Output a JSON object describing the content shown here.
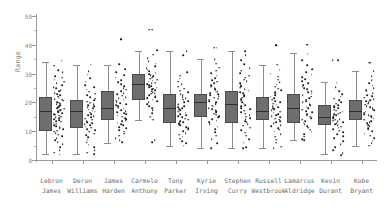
{
  "chart_data": {
    "type": "box",
    "title": "",
    "xlabel": "",
    "ylabel": "Range",
    "ylim": [
      0,
      50
    ],
    "yticks": [
      0,
      10,
      20,
      30,
      40,
      50
    ],
    "ytick_labels": [
      "0",
      "10",
      "20",
      "30",
      "40",
      "50"
    ],
    "grid": false,
    "legend": "none",
    "overlay": "jittered strip plot of individual observations",
    "categories": [
      "Lebron James",
      "Deron Williams",
      "James Harden",
      "Carmelo Anthony",
      "Tony Parker",
      "Kyrie Irving",
      "Stephen Curry",
      "Russell Westbrook",
      "Lamarcus Aldridge",
      "Kevin Durant",
      "Kobe Bryant"
    ],
    "category_lines": [
      [
        "Lebron",
        "James"
      ],
      [
        "Deron",
        "Williams"
      ],
      [
        "James",
        "Harden"
      ],
      [
        "Carmelo",
        "Anthony"
      ],
      [
        "Tony",
        "Parker"
      ],
      [
        "Kyrie",
        "Irving"
      ],
      [
        "Stephen",
        "Curry"
      ],
      [
        "Russell",
        "Westbrook"
      ],
      [
        "Lamarcus",
        "Aldridge"
      ],
      [
        "Kevin",
        "Durant"
      ],
      [
        "Kobe",
        "Bryant"
      ]
    ],
    "boxes": [
      {
        "name": "Lebron James",
        "whisker_low": 2,
        "q1": 10,
        "median": 17,
        "q3": 22,
        "whisker_high": 34
      },
      {
        "name": "Deron Williams",
        "whisker_low": 2,
        "q1": 11,
        "median": 17,
        "q3": 21,
        "whisker_high": 33
      },
      {
        "name": "James Harden",
        "whisker_low": 6,
        "q1": 14,
        "median": 18,
        "q3": 24,
        "whisker_high": 33
      },
      {
        "name": "Carmelo Anthony",
        "whisker_low": 14,
        "q1": 21,
        "median": 26.5,
        "q3": 30,
        "whisker_high": 38
      },
      {
        "name": "Tony Parker",
        "whisker_low": 5,
        "q1": 13,
        "median": 18,
        "q3": 23,
        "whisker_high": 38
      },
      {
        "name": "Kyrie Irving",
        "whisker_low": 4,
        "q1": 15,
        "median": 20,
        "q3": 23,
        "whisker_high": 35
      },
      {
        "name": "Stephen Curry",
        "whisker_low": 4,
        "q1": 13,
        "median": 19.5,
        "q3": 24,
        "whisker_high": 38
      },
      {
        "name": "Russell Westbrook",
        "whisker_low": 4,
        "q1": 14,
        "median": 17,
        "q3": 22,
        "whisker_high": 33
      },
      {
        "name": "Lamarcus Aldridge",
        "whisker_low": 7,
        "q1": 13,
        "median": 18,
        "q3": 23,
        "whisker_high": 37
      },
      {
        "name": "Kevin Durant",
        "whisker_low": 2,
        "q1": 12,
        "median": 15,
        "q3": 19,
        "whisker_high": 27
      },
      {
        "name": "Kobe Bryant",
        "whisker_low": 5,
        "q1": 14,
        "median": 17,
        "q3": 21,
        "whisker_high": 31
      }
    ],
    "outliers": [
      {
        "name": "James Harden",
        "values": [
          42
        ]
      },
      {
        "name": "Carmelo Anthony",
        "values": [
          45.3
        ]
      },
      {
        "name": "Kyrie Irving",
        "values": [
          39
        ]
      },
      {
        "name": "Russell Westbrook",
        "values": [
          39.8
        ]
      },
      {
        "name": "Lamarcus Aldridge",
        "values": [
          40
        ]
      },
      {
        "name": "Kevin Durant",
        "values": [
          34.6
        ]
      },
      {
        "name": "Kobe Bryant",
        "values": [
          33.8
        ]
      }
    ],
    "points": [
      {
        "name": "Lebron James",
        "values": [
          34.5,
          32.8,
          31.2,
          30.4,
          29.1,
          28.6,
          27.9,
          27.2,
          26.6,
          26.0,
          25.4,
          24.9,
          24.3,
          23.8,
          23.2,
          22.8,
          22.4,
          22.0,
          21.6,
          21.2,
          20.9,
          20.6,
          20.2,
          19.9,
          19.6,
          19.3,
          19.0,
          18.7,
          18.4,
          18.1,
          17.8,
          17.5,
          17.2,
          16.9,
          16.6,
          16.3,
          16.0,
          15.7,
          15.4,
          15.1,
          14.8,
          14.5,
          14.2,
          13.9,
          13.6,
          13.3,
          13.0,
          12.6,
          12.2,
          11.8,
          11.4,
          11.0,
          10.6,
          10.2,
          9.8,
          9.3,
          8.8,
          8.2,
          7.6,
          6.9,
          6.2,
          5.4,
          4.5,
          3.5,
          2.6,
          1.9
        ]
      },
      {
        "name": "Deron Williams",
        "values": [
          33.1,
          30.8,
          29.6,
          28.4,
          27.2,
          26.1,
          25.2,
          24.4,
          23.7,
          23.0,
          22.4,
          21.8,
          21.3,
          20.8,
          20.3,
          19.9,
          19.5,
          19.1,
          18.7,
          18.3,
          17.9,
          17.5,
          17.1,
          16.8,
          16.4,
          16.0,
          15.6,
          15.2,
          14.8,
          14.4,
          14.0,
          13.6,
          13.2,
          12.8,
          12.4,
          12.0,
          11.6,
          11.2,
          10.8,
          10.3,
          9.8,
          9.2,
          8.6,
          7.9,
          7.1,
          6.2,
          5.3,
          4.4,
          3.5,
          2.6,
          2.0
        ]
      },
      {
        "name": "James Harden",
        "values": [
          42.0,
          33.2,
          31.6,
          30.5,
          29.5,
          28.6,
          27.8,
          27.0,
          26.3,
          25.6,
          25.0,
          24.4,
          23.8,
          23.3,
          22.8,
          22.3,
          21.9,
          21.4,
          21.0,
          20.6,
          20.2,
          19.8,
          19.4,
          19.0,
          18.6,
          18.2,
          17.8,
          17.4,
          17.0,
          16.6,
          16.2,
          15.8,
          15.4,
          15.0,
          14.6,
          14.2,
          13.8,
          13.4,
          13.0,
          12.5,
          12.0,
          11.5,
          11.0,
          10.4,
          9.8,
          9.1,
          8.4,
          7.6,
          6.8,
          6.1
        ]
      },
      {
        "name": "Carmelo Anthony",
        "values": [
          45.3,
          38.1,
          36.6,
          35.4,
          34.4,
          33.5,
          32.7,
          32.0,
          31.4,
          30.8,
          30.3,
          29.8,
          29.4,
          29.0,
          28.6,
          28.2,
          27.9,
          27.5,
          27.2,
          26.9,
          26.6,
          26.3,
          26.0,
          25.7,
          25.4,
          25.1,
          24.8,
          24.5,
          24.2,
          23.9,
          23.6,
          23.3,
          23.0,
          22.6,
          22.2,
          21.8,
          21.4,
          21.0,
          20.5,
          20.0,
          19.4,
          18.8,
          18.0,
          17.2,
          16.2,
          15.1,
          14.0,
          6.8,
          6.2
        ]
      },
      {
        "name": "Tony Parker",
        "values": [
          37.9,
          36.4,
          30.6,
          29.3,
          28.2,
          27.2,
          26.3,
          25.5,
          24.8,
          24.1,
          23.5,
          22.9,
          22.4,
          21.9,
          21.4,
          20.9,
          20.4,
          20.0,
          19.6,
          19.2,
          18.8,
          18.4,
          18.0,
          17.6,
          17.2,
          16.8,
          16.4,
          16.0,
          15.6,
          15.2,
          14.8,
          14.4,
          14.0,
          13.6,
          13.2,
          12.8,
          12.4,
          12.0,
          11.5,
          11.0,
          10.5,
          10.0,
          9.4,
          8.8,
          8.1,
          7.4,
          6.6,
          5.8,
          5.0
        ]
      },
      {
        "name": "Kyrie Irving",
        "values": [
          39.0,
          35.1,
          33.4,
          32.1,
          31.0,
          30.1,
          29.3,
          28.5,
          27.8,
          27.2,
          26.6,
          26.0,
          25.5,
          25.0,
          24.5,
          24.1,
          23.7,
          23.3,
          22.9,
          22.5,
          22.1,
          21.7,
          21.3,
          20.9,
          20.5,
          20.1,
          19.7,
          19.3,
          18.9,
          18.5,
          18.1,
          17.7,
          17.3,
          16.9,
          16.5,
          16.1,
          15.7,
          15.3,
          14.8,
          14.3,
          13.7,
          13.1,
          12.4,
          11.6,
          10.7,
          9.7,
          8.5,
          7.2,
          5.8,
          4.2
        ]
      },
      {
        "name": "Stephen Curry",
        "values": [
          37.8,
          36.3,
          34.6,
          33.2,
          32.0,
          31.0,
          30.1,
          29.3,
          28.6,
          27.9,
          27.3,
          26.7,
          26.1,
          25.6,
          25.1,
          24.6,
          24.1,
          23.6,
          23.1,
          22.6,
          22.1,
          21.6,
          21.1,
          20.6,
          20.1,
          19.6,
          19.1,
          18.6,
          18.1,
          17.6,
          17.1,
          16.6,
          16.1,
          15.6,
          15.1,
          14.6,
          14.1,
          13.6,
          13.1,
          12.5,
          11.9,
          11.2,
          10.4,
          9.5,
          8.5,
          7.3,
          6.0,
          4.4,
          4.0
        ]
      },
      {
        "name": "Russell Westbrook",
        "values": [
          39.8,
          33.1,
          31.4,
          30.0,
          28.9,
          27.9,
          27.0,
          26.2,
          25.5,
          24.8,
          24.2,
          23.6,
          23.0,
          22.5,
          22.0,
          21.5,
          21.0,
          20.5,
          20.0,
          19.6,
          19.2,
          18.8,
          18.4,
          18.0,
          17.6,
          17.2,
          16.8,
          16.4,
          16.0,
          15.6,
          15.2,
          14.8,
          14.4,
          14.0,
          13.6,
          13.2,
          12.7,
          12.2,
          11.7,
          11.1,
          10.5,
          9.8,
          9.0,
          8.1,
          7.1,
          6.0,
          4.6,
          4.0
        ]
      },
      {
        "name": "Lamarcus Aldridge",
        "values": [
          40.0,
          36.9,
          34.6,
          32.9,
          31.6,
          30.5,
          29.6,
          28.8,
          28.0,
          27.3,
          26.7,
          26.1,
          25.5,
          25.0,
          24.5,
          24.0,
          23.5,
          23.0,
          22.5,
          22.0,
          21.5,
          21.0,
          20.5,
          20.0,
          19.5,
          19.0,
          18.5,
          18.0,
          17.5,
          17.0,
          16.5,
          16.0,
          15.5,
          15.0,
          14.5,
          14.0,
          13.5,
          13.0,
          12.4,
          11.8,
          11.2,
          10.5,
          9.8,
          9.0,
          8.1,
          7.2,
          6.8
        ]
      },
      {
        "name": "Kevin Durant",
        "values": [
          34.6,
          26.9,
          25.2,
          23.9,
          22.9,
          22.0,
          21.3,
          20.7,
          20.1,
          19.6,
          19.1,
          18.7,
          18.3,
          17.9,
          17.5,
          17.1,
          16.8,
          16.4,
          16.1,
          15.8,
          15.5,
          15.2,
          14.9,
          14.6,
          14.3,
          14.0,
          13.7,
          13.4,
          13.1,
          12.8,
          12.4,
          12.0,
          11.6,
          11.2,
          10.7,
          10.2,
          9.6,
          9.0,
          8.3,
          7.5,
          6.6,
          5.6,
          4.5,
          3.4,
          2.4,
          1.8
        ]
      },
      {
        "name": "Kobe Bryant",
        "values": [
          33.8,
          30.8,
          29.1,
          27.8,
          26.7,
          25.8,
          25.0,
          24.3,
          23.7,
          23.1,
          22.6,
          22.1,
          21.6,
          21.2,
          20.8,
          20.4,
          20.0,
          19.6,
          19.2,
          18.8,
          18.4,
          18.0,
          17.6,
          17.2,
          16.8,
          16.4,
          16.0,
          15.6,
          15.2,
          14.8,
          14.4,
          14.0,
          13.6,
          13.2,
          12.7,
          12.2,
          11.7,
          11.1,
          10.5,
          9.9,
          9.2,
          8.4,
          7.6,
          6.7,
          5.8,
          5.0
        ]
      }
    ],
    "colors": {
      "box_fill": "#6e6e6e",
      "box_edge": "#4a4a4a",
      "median": "#2e2e2e",
      "whisker": "#8c8c8c",
      "point": "#1d1d1d",
      "axis": "#9a9a9a",
      "tick_text": "#8a8a8a",
      "label_text": "#6d6d6d",
      "background": "#ffffff"
    }
  }
}
